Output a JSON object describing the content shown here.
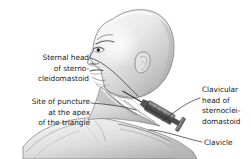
{
  "figure": {
    "background_color": "#ffffff",
    "ink_color": "#1b1b1b",
    "skin_light": "#f2f2f2",
    "skin_mid": "#cfcfcf",
    "skin_shadow": "#9a9a9a",
    "syringe_color": "#4a4a4a"
  },
  "labels": {
    "sternal_head": "Sternal head\nof sterno-\ncleidomastoid",
    "site_of_puncture": "Site of puncture\nat the apex\nof the triangle",
    "clavicular_head": "Clavicular\nhead of\nsternoclei-\ndomastoid",
    "clavicle": "Clavicle"
  },
  "anatomy": {
    "items": [
      "sternal head of sternocleidomastoid",
      "clavicular head of sternocleidomastoid",
      "clavicle",
      "apex of the triangle"
    ]
  },
  "instrument": {
    "name": "syringe",
    "description": "syringe with needle inserted at the apex of the triangle"
  }
}
